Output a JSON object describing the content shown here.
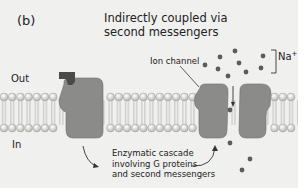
{
  "figure": {
    "panel_label": "(b)",
    "title_line1": "Indirectly coupled via",
    "title_line2": "second messengers"
  },
  "labels": {
    "outside": "Out",
    "inside": "In",
    "ion_channel": "Ion channel",
    "ion": "Na",
    "ion_charge": "+",
    "cascade_line1": "Enzymatic cascade",
    "cascade_line2": "involving G proteins",
    "cascade_line3": "and second messengers"
  },
  "colors": {
    "background": "#f0f0ef",
    "protein": "#8a8a88",
    "ligand": "#4a4a4a",
    "ion_dot": "#5a5a5a",
    "lipid_head": "#d8d8d6",
    "text": "#222222"
  }
}
